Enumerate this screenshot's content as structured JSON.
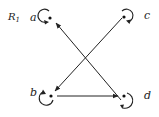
{
  "diagram": {
    "relation_label": "R",
    "relation_subscript": "1",
    "nodes": [
      {
        "id": "a",
        "label": "a",
        "self_loop": true
      },
      {
        "id": "b",
        "label": "b",
        "self_loop": true
      },
      {
        "id": "c",
        "label": "c",
        "self_loop": true
      },
      {
        "id": "d",
        "label": "d",
        "self_loop": true
      }
    ],
    "edges": [
      {
        "from": "c",
        "to": "b"
      },
      {
        "from": "d",
        "to": "a"
      },
      {
        "from": "b",
        "to": "d"
      }
    ],
    "colors": {
      "stroke": "#222222",
      "background": "#ffffff"
    }
  }
}
